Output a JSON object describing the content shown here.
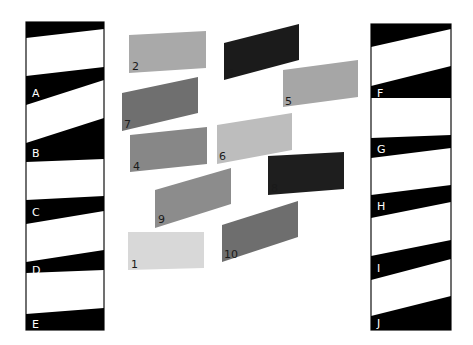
{
  "figure": {
    "background": "#ffffff"
  },
  "left_column": {
    "x": 26,
    "y": 22,
    "width": 78,
    "height": 308,
    "border_color": "#111111",
    "bands": [
      {
        "label": "",
        "points": "26,22 104,22 104,29 26,38"
      },
      {
        "label": "A",
        "points": "26,76 104,67 104,80 26,105",
        "label_x": 32,
        "label_y": 97
      },
      {
        "label": "B",
        "points": "26,143 104,118 104,159 26,162",
        "label_x": 32,
        "label_y": 157
      },
      {
        "label": "C",
        "points": "26,200 104,196 104,211 26,224",
        "label_x": 32,
        "label_y": 216
      },
      {
        "label": "D",
        "points": "26,262 104,250 104,270 26,273",
        "label_x": 32,
        "label_y": 274
      },
      {
        "label": "E",
        "points": "26,314 104,308 104,330 26,330",
        "label_x": 32,
        "label_y": 328
      }
    ]
  },
  "right_column": {
    "x": 371,
    "y": 24,
    "width": 80,
    "height": 306,
    "border_color": "#111111",
    "bands": [
      {
        "label": "",
        "points": "371,24 451,24 451,29 371,47"
      },
      {
        "label": "F",
        "points": "371,86 451,66 451,98 371,98",
        "label_x": 377,
        "label_y": 97
      },
      {
        "label": "G",
        "points": "371,138 451,135 451,148 371,158",
        "label_x": 377,
        "label_y": 153
      },
      {
        "label": "H",
        "points": "371,195 451,185 451,202 371,218",
        "label_x": 377,
        "label_y": 210
      },
      {
        "label": "I",
        "points": "371,256 451,240 451,259 371,280",
        "label_x": 377,
        "label_y": 272
      },
      {
        "label": "J",
        "points": "371,316 451,296 451,330 371,330",
        "label_x": 377,
        "label_y": 327
      }
    ]
  },
  "patches": [
    {
      "number": "1",
      "color": "#d8d8d8",
      "points": "128,232 204,232 204,268 128,270",
      "label_x": 131,
      "label_y": 268
    },
    {
      "number": "2",
      "color": "#a9a9a9",
      "points": "129,35 206,31 206,68 129,73",
      "label_x": 132,
      "label_y": 70
    },
    {
      "number": "3",
      "color": "#1b1b1b",
      "points": "224,43 299,24 299,60 224,80",
      "label_x": 227,
      "label_y": 77
    },
    {
      "number": "4",
      "color": "#878787",
      "points": "130,135 207,127 207,164 130,172",
      "label_x": 133,
      "label_y": 170
    },
    {
      "number": "5",
      "color": "#a6a6a6",
      "points": "283,70 358,60 358,97 283,107",
      "label_x": 285,
      "label_y": 105
    },
    {
      "number": "6",
      "color": "#bdbdbd",
      "points": "217,125 292,113 292,150 217,164",
      "label_x": 219,
      "label_y": 160
    },
    {
      "number": "7",
      "color": "#6f6f6f",
      "points": "122,93 198,77 198,113 122,131",
      "label_x": 124,
      "label_y": 128
    },
    {
      "number": "8",
      "color": "#1e1e1e",
      "points": "268,156 344,152 344,189 268,195",
      "label_x": 271,
      "label_y": 192
    },
    {
      "number": "9",
      "color": "#8c8c8c",
      "points": "155,190 231,168 231,204 155,228",
      "label_x": 158,
      "label_y": 223
    },
    {
      "number": "10",
      "color": "#6e6e6e",
      "points": "222,225 298,201 298,237 222,262",
      "label_x": 224,
      "label_y": 258
    }
  ]
}
